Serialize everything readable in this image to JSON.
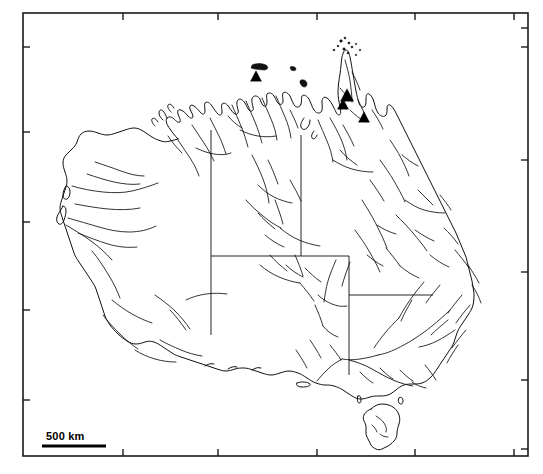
{
  "figure": {
    "type": "distribution-map",
    "region": "Australia",
    "title": "",
    "background_color": "#ffffff",
    "line_color": "#111111",
    "marker_color": "#000000"
  },
  "frame": {
    "x": 23,
    "y": 13,
    "width": 505,
    "height": 443,
    "stroke": "#1a1a1a",
    "tick_length": 7,
    "ticks_x": [
      123,
      218,
      317,
      415,
      514
    ],
    "ticks_y": [
      47,
      132,
      222,
      310,
      400,
      449
    ]
  },
  "scale_bar": {
    "label": "500 km",
    "line_x1": 42,
    "line_x2": 106,
    "line_y": 446,
    "text_x": 46,
    "text_y": 440
  },
  "markers": {
    "symbol": "filled-triangle",
    "count": 4,
    "points": [
      {
        "id": "site-1",
        "region": "Arnhem Land, Northern Territory",
        "x": 256,
        "y": 76,
        "size": 11
      },
      {
        "id": "site-2",
        "region": "Cape York Peninsula, Queensland",
        "x": 347,
        "y": 95,
        "size": 13
      },
      {
        "id": "site-3",
        "region": "Cape York Peninsula, Queensland",
        "x": 343,
        "y": 104,
        "size": 11
      },
      {
        "id": "site-4",
        "region": "North Queensland",
        "x": 364,
        "y": 117,
        "size": 11
      }
    ]
  },
  "state_borders": [
    {
      "name": "wa-nt-sa-border",
      "description": "Western Australia eastern boundary, 129E meridian"
    },
    {
      "name": "nt-qld-border",
      "description": "Northern Territory / Queensland boundary, 138E meridian"
    },
    {
      "name": "sa-nsw-qld-border",
      "description": "South Australia northern boundary, 26S parallel"
    },
    {
      "name": "nsw-qld-border",
      "description": "New South Wales / Queensland boundary, 29S parallel"
    },
    {
      "name": "nsw-vic-border",
      "description": "New South Wales / Victoria boundary, Murray River"
    }
  ],
  "features": {
    "islands_label": "Torres Strait Islands",
    "tasmania_label": "Tasmania",
    "rivers_label": "Drainage network"
  }
}
